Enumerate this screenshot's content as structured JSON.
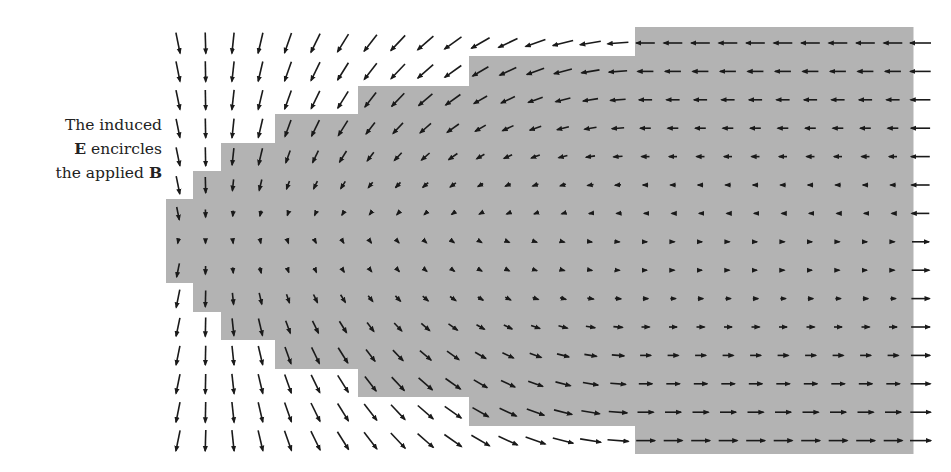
{
  "caption": {
    "line1": "The induced",
    "line2_bold": "E",
    "line2_rest": " encircles",
    "line3_rest": "the applied ",
    "line3_bold": "B"
  },
  "diagram": {
    "colors": {
      "region_fill": "#b3b3b3",
      "arrow": "#1a1a1a",
      "background": "#ffffff"
    },
    "grid": {
      "x0": 178,
      "dx": 27.5,
      "cols": 28,
      "y0": 43,
      "dy": 28.4,
      "rows": 15,
      "axis_y": 241
    },
    "region_steps": [
      {
        "x_start": 166,
        "x_end": 193,
        "top": 199,
        "bottom": 283
      },
      {
        "x_start": 193,
        "x_end": 221,
        "top": 171,
        "bottom": 312
      },
      {
        "x_start": 221,
        "x_end": 275,
        "top": 143,
        "bottom": 340
      },
      {
        "x_start": 275,
        "x_end": 358,
        "top": 114,
        "bottom": 369
      },
      {
        "x_start": 358,
        "x_end": 469,
        "top": 86,
        "bottom": 397
      },
      {
        "x_start": 469,
        "x_end": 635,
        "top": 56,
        "bottom": 426
      },
      {
        "x_start": 635,
        "x_end": 913,
        "top": 27,
        "bottom": 454
      }
    ]
  }
}
